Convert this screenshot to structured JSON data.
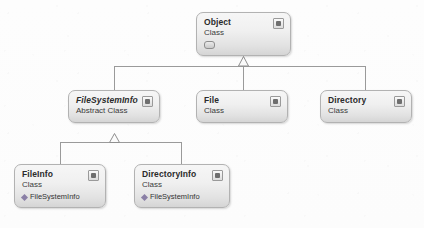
{
  "diagram": {
    "type": "uml-class-diagram",
    "background_color": "#fdfdfd",
    "box_border_color": "#b2b2b2",
    "connector_color": "#9a9a9a"
  },
  "classes": [
    {
      "id": "object",
      "name": "Object",
      "kind": "Class",
      "stereotype": "",
      "abstract": false,
      "members": [],
      "has_glyph_row": true,
      "collapse_icon": "collapse-chevron-icon",
      "x": 196,
      "y": 12,
      "w": 95,
      "h": 44
    },
    {
      "id": "filesysteminfo",
      "name": "FileSystemInfo",
      "kind": "Abstract Class",
      "stereotype": "",
      "abstract": true,
      "members": [],
      "has_glyph_row": false,
      "collapse_icon": "collapse-chevron-icon",
      "x": 68,
      "y": 90,
      "w": 92,
      "h": 33
    },
    {
      "id": "file",
      "name": "File",
      "kind": "Class",
      "stereotype": "",
      "abstract": false,
      "members": [],
      "has_glyph_row": false,
      "collapse_icon": "collapse-chevron-icon",
      "x": 196,
      "y": 90,
      "w": 92,
      "h": 33
    },
    {
      "id": "directory",
      "name": "Directory",
      "kind": "Class",
      "stereotype": "",
      "abstract": false,
      "members": [],
      "has_glyph_row": false,
      "collapse_icon": "collapse-chevron-icon",
      "x": 320,
      "y": 90,
      "w": 92,
      "h": 33
    },
    {
      "id": "fileinfo",
      "name": "FileInfo",
      "kind": "Class",
      "stereotype": "",
      "abstract": false,
      "members": [
        {
          "marker": "method-marker-icon",
          "label": "FileSystemInfo"
        }
      ],
      "has_glyph_row": false,
      "collapse_icon": "collapse-chevron-icon",
      "x": 14,
      "y": 164,
      "w": 92,
      "h": 44
    },
    {
      "id": "directoryinfo",
      "name": "DirectoryInfo",
      "kind": "Class",
      "stereotype": "",
      "abstract": false,
      "members": [
        {
          "marker": "method-marker-icon",
          "label": "FileSystemInfo"
        }
      ],
      "has_glyph_row": false,
      "collapse_icon": "collapse-chevron-icon",
      "x": 134,
      "y": 164,
      "w": 96,
      "h": 44
    }
  ],
  "relationships": [
    {
      "type": "inheritance",
      "from": "filesysteminfo",
      "to": "object"
    },
    {
      "type": "inheritance",
      "from": "file",
      "to": "object"
    },
    {
      "type": "inheritance",
      "from": "directory",
      "to": "object"
    },
    {
      "type": "inheritance",
      "from": "fileinfo",
      "to": "filesysteminfo"
    },
    {
      "type": "inheritance",
      "from": "directoryinfo",
      "to": "filesysteminfo"
    }
  ]
}
